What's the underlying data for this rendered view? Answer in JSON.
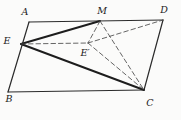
{
  "diagram": {
    "canvas": {
      "width": 181,
      "height": 120,
      "background": "#fbfbfa"
    },
    "colors": {
      "edge_stroke": "#2b2b2b",
      "bold_stroke": "#1d1d1d",
      "dashed_stroke": "#4a4a4a",
      "label_color": "#1a1a1a"
    },
    "stroke_widths": {
      "edge": 1.2,
      "bold": 1.9,
      "dashed": 0.85
    },
    "dash_pattern": "4.5 3",
    "points": {
      "A": {
        "x": 29,
        "y": 22
      },
      "M": {
        "x": 100,
        "y": 21
      },
      "D": {
        "x": 163,
        "y": 20
      },
      "E": {
        "x": 21,
        "y": 44
      },
      "Eprime": {
        "x": 88,
        "y": 43
      },
      "B": {
        "x": 8,
        "y": 92
      },
      "C": {
        "x": 144,
        "y": 90
      }
    },
    "labels": [
      {
        "id": "A",
        "text": "A",
        "x": 25,
        "y": 12
      },
      {
        "id": "M",
        "text": "M",
        "x": 102,
        "y": 11
      },
      {
        "id": "D",
        "text": "D",
        "x": 164,
        "y": 10
      },
      {
        "id": "E",
        "text": "E",
        "x": 7,
        "y": 41
      },
      {
        "id": "Eprime",
        "text": "E′",
        "x": 85,
        "y": 53
      },
      {
        "id": "B",
        "text": "B",
        "x": 9,
        "y": 99
      },
      {
        "id": "C",
        "text": "C",
        "x": 150,
        "y": 103
      }
    ],
    "segments": [
      {
        "from": "A",
        "to": "D",
        "style": "edge"
      },
      {
        "from": "D",
        "to": "C",
        "style": "edge"
      },
      {
        "from": "C",
        "to": "B",
        "style": "edge"
      },
      {
        "from": "B",
        "to": "A",
        "style": "edge"
      },
      {
        "from": "E",
        "to": "M",
        "style": "bold"
      },
      {
        "from": "E",
        "to": "C",
        "style": "bold"
      },
      {
        "from": "E",
        "to": "Eprime",
        "style": "dashed"
      },
      {
        "from": "M",
        "to": "Eprime",
        "style": "dashed"
      },
      {
        "from": "Eprime",
        "to": "D",
        "style": "dashed"
      },
      {
        "from": "Eprime",
        "to": "C",
        "style": "dashed"
      },
      {
        "from": "M",
        "to": "C",
        "style": "dashed"
      }
    ]
  }
}
